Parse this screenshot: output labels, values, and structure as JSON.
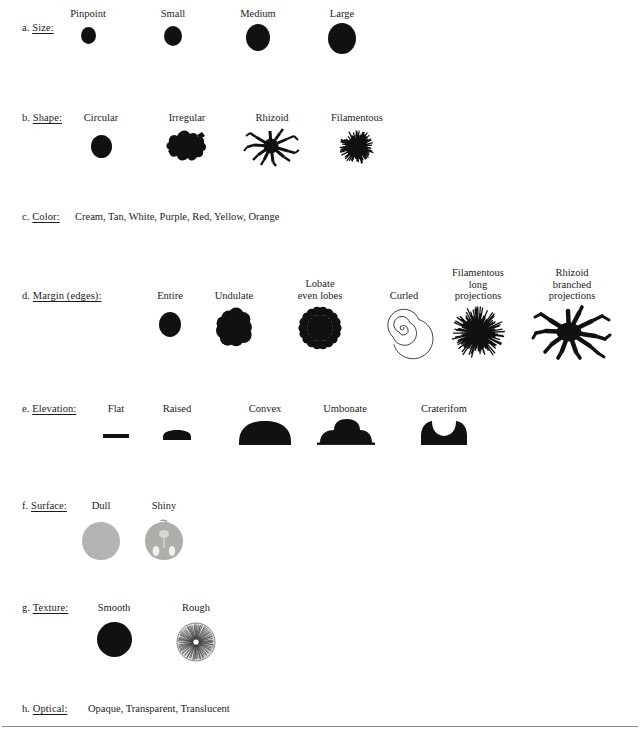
{
  "document": {
    "type": "colony-morphology-reference-figure",
    "background": "#ffffff",
    "ink": "#111111"
  },
  "sections": [
    {
      "key": "size",
      "letter": "a.",
      "label": "Size:",
      "label_x": 22,
      "label_y": 22,
      "items": [
        {
          "label": "Pinpoint",
          "x": 88,
          "label_y": 8,
          "glyph": "circle",
          "size": 15
        },
        {
          "label": "Small",
          "x": 173,
          "label_y": 8,
          "glyph": "circle",
          "size": 18
        },
        {
          "label": "Medium",
          "x": 258,
          "label_y": 8,
          "glyph": "circle",
          "size": 24
        },
        {
          "label": "Large",
          "x": 342,
          "label_y": 8,
          "glyph": "circle",
          "size": 27
        }
      ]
    },
    {
      "key": "shape",
      "letter": "b.",
      "label": "Shape:",
      "label_x": 22,
      "label_y": 112,
      "items": [
        {
          "label": "Circular",
          "x": 101,
          "label_y": 112,
          "glyph": "circle",
          "size": 21
        },
        {
          "label": "Irregular",
          "x": 187,
          "label_y": 112,
          "glyph": "irregular",
          "size": 34
        },
        {
          "label": "Rhizoid",
          "x": 272,
          "label_y": 112,
          "glyph": "rhizoid",
          "size": 40
        },
        {
          "label": "Filamentous",
          "x": 357,
          "label_y": 112,
          "glyph": "filamentous",
          "size": 38
        }
      ]
    },
    {
      "key": "color",
      "letter": "c.",
      "label": "Color:",
      "label_x": 22,
      "label_y": 211,
      "values_text": "Cream, Tan, White, Purple, Red, Yellow, Orange",
      "values_x": 75,
      "values": [
        "Cream",
        "Tan",
        "White",
        "Purple",
        "Red",
        "Yellow",
        "Orange"
      ]
    },
    {
      "key": "margin",
      "letter": "d.",
      "label": "Margin (edges):",
      "label_x": 22,
      "label_y": 290,
      "items": [
        {
          "label": "Entire",
          "x": 170,
          "label_y": 290,
          "glyph": "circle",
          "size": 22
        },
        {
          "label": "Undulate",
          "x": 234,
          "label_y": 290,
          "glyph": "undulate",
          "size": 42
        },
        {
          "label": "Lobate\neven lobes",
          "x": 320,
          "label_y": 278,
          "glyph": "lobate",
          "size": 44
        },
        {
          "label": "Curled",
          "x": 404,
          "label_y": 290,
          "glyph": "curled",
          "size": 40
        },
        {
          "label": "Filamentous\nlong\nprojections",
          "x": 477,
          "label_y": 267,
          "glyph": "filamentous-long",
          "size": 52
        },
        {
          "label": "Rhizoid\nbranched\nprojections",
          "x": 570,
          "label_y": 267,
          "glyph": "rhizoid-branched",
          "size": 58
        }
      ]
    },
    {
      "key": "elevation",
      "letter": "e.",
      "label": "Elevation:",
      "label_x": 22,
      "label_y": 403,
      "items": [
        {
          "label": "Flat",
          "x": 116,
          "label_y": 403,
          "glyph": "flat",
          "size": 26
        },
        {
          "label": "Raised",
          "x": 177,
          "label_y": 403,
          "glyph": "raised",
          "size": 28
        },
        {
          "label": "Convex",
          "x": 265,
          "label_y": 403,
          "glyph": "convex",
          "size": 56
        },
        {
          "label": "Umbonate",
          "x": 345,
          "label_y": 403,
          "glyph": "umbonate",
          "size": 58
        },
        {
          "label": "Craterifom",
          "x": 444,
          "label_y": 403,
          "glyph": "crateriform",
          "size": 52
        }
      ]
    },
    {
      "key": "surface",
      "letter": "f.",
      "label": "Surface:",
      "label_x": 22,
      "label_y": 500,
      "items": [
        {
          "label": "Dull",
          "x": 101,
          "label_y": 500,
          "glyph": "dull",
          "size": 38,
          "color": "#b3b3b3"
        },
        {
          "label": "Shiny",
          "x": 164,
          "label_y": 500,
          "glyph": "shiny",
          "size": 38,
          "color": "#b0b0ac"
        }
      ]
    },
    {
      "key": "texture",
      "letter": "g.",
      "label": "Texture:",
      "label_x": 22,
      "label_y": 602,
      "items": [
        {
          "label": "Smooth",
          "x": 114,
          "label_y": 602,
          "glyph": "circle",
          "size": 34
        },
        {
          "label": "Rough",
          "x": 196,
          "label_y": 602,
          "glyph": "rough",
          "size": 38
        }
      ]
    },
    {
      "key": "optical",
      "letter": "h.",
      "label": "Optical:",
      "label_x": 22,
      "label_y": 703,
      "values_text": "Opaque, Transparent, Translucent",
      "values_x": 88,
      "values": [
        "Opaque",
        "Transparent",
        "Translucent"
      ]
    }
  ],
  "footer_rule": {
    "y": 726
  }
}
